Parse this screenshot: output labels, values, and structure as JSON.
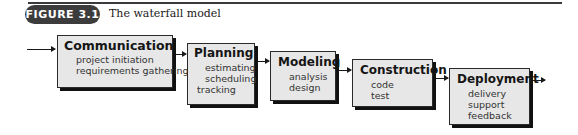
{
  "figure": {
    "label": "FIGURE 3.1",
    "caption": "The waterfall model"
  },
  "phases": [
    {
      "title": "Communication",
      "items": [
        "project initiation",
        "requirements gathering"
      ]
    },
    {
      "title": "Planning",
      "items": [
        "estimating",
        "scheduling",
        "tracking"
      ]
    },
    {
      "title": "Modeling",
      "items": [
        "analysis",
        "design"
      ]
    },
    {
      "title": "Construction",
      "items": [
        "code",
        "test"
      ]
    },
    {
      "title": "Deployment",
      "items": [
        "delivery",
        "support",
        "feedback"
      ]
    }
  ],
  "colors": {
    "box_fill": "#e7e7e7",
    "box_shadow": "#111111",
    "label_bg": "#3c3c3c"
  }
}
